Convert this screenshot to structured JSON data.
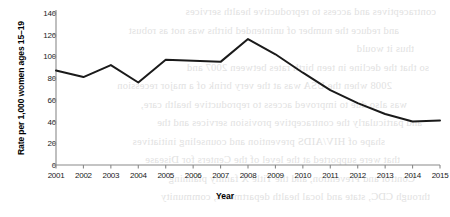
{
  "chart_data": {
    "type": "line",
    "title": "",
    "xlabel": "Year",
    "ylabel": "Rate per 1,000 women ages 15–19",
    "categories": [
      "2001",
      "2002",
      "2003",
      "2004",
      "2005",
      "2006",
      "2007",
      "2008",
      "2009",
      "2010",
      "2011",
      "2012",
      "2013",
      "2014",
      "2015"
    ],
    "values": [
      87,
      81,
      92,
      76,
      97,
      96,
      95,
      116,
      102,
      85,
      69,
      57,
      47,
      40,
      41
    ],
    "x": [
      2001,
      2002,
      2003,
      2004,
      2005,
      2006,
      2007,
      2008,
      2009,
      2010,
      2011,
      2012,
      2013,
      2014,
      2015
    ],
    "ylim": [
      0,
      140
    ],
    "yticks": [
      "0",
      "20",
      "40",
      "60",
      "80",
      "100",
      "120",
      "140"
    ],
    "ytick_values": [
      0,
      20,
      40,
      60,
      80,
      100,
      120,
      140
    ],
    "xlim": [
      2001,
      2015
    ],
    "grid": false,
    "legend": false,
    "legend_position": "none",
    "series_color": "#1a1a1a",
    "axis_color": "#8a8a8a",
    "marker": "none",
    "line_width": 2
  },
  "background_bleed": {
    "description": "faint mirrored show-through text from the reverse side of the printed page",
    "color": "#c9c9c9",
    "lines": [
      "contraceptives and access to reproductive health services",
      "and reduce the number of unintended births was not as robust",
      "thus it would",
      "so that the decline in teen birth rates between 2007 and",
      "2008 when the USA was at the very brink of a major recession",
      "was also due to improved access to reproductive health care,",
      "and particularly the contraceptive provision services and the",
      "shape of HIV/AIDS prevention and counseling initiatives",
      "that were supported at the level of the Centers for Disease",
      "Control and Prevention, and the Title X family planning",
      "through CDC, state and local health departments, community"
    ]
  }
}
